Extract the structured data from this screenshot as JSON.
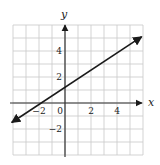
{
  "chart_data": {
    "type": "line",
    "title": "",
    "xlabel": "x",
    "ylabel": "y",
    "xlim": [
      -4,
      6
    ],
    "ylim": [
      -4,
      6
    ],
    "grid": true,
    "grid_step": 1,
    "x_ticks": [
      {
        "value": -2,
        "label": "−2"
      },
      {
        "value": 0,
        "label": "0"
      },
      {
        "value": 2,
        "label": "2"
      },
      {
        "value": 4,
        "label": "4"
      }
    ],
    "y_ticks": [
      {
        "value": 4,
        "label": "4"
      },
      {
        "value": 2,
        "label": "2"
      },
      {
        "value": -2,
        "label": "−2"
      }
    ],
    "series": [
      {
        "name": "line",
        "style": "straight line with arrows at both ends",
        "x": [
          -4.1,
          5.9
        ],
        "y": [
          -1.5,
          5.1
        ],
        "passes_through": [
          [
            -2,
            0
          ],
          [
            0,
            1.2
          ]
        ]
      }
    ]
  }
}
